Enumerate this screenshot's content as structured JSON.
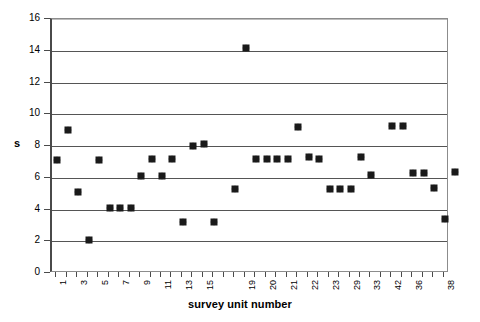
{
  "chart_data": {
    "type": "scatter",
    "title": "",
    "xlabel": "survey unit number",
    "ylabel": "s",
    "ylim": [
      0,
      16
    ],
    "ytick_step": 2,
    "yticks": [
      0,
      2,
      4,
      6,
      8,
      10,
      12,
      14,
      16
    ],
    "grid": true,
    "grid_axis": "y",
    "legend": false,
    "marker": "diamond",
    "marker_color": "#1a1a1a",
    "categories": [
      "1",
      "2",
      "3",
      "4",
      "5",
      "6",
      "7",
      "8",
      "9",
      "10",
      "11",
      "12",
      "13",
      "14",
      "15",
      "16",
      "17",
      "18",
      "19",
      "20",
      "21",
      "22",
      "23",
      "24",
      "25",
      "26",
      "27",
      "28",
      "29",
      "30",
      "31",
      "32",
      "33",
      "34",
      "35",
      "36",
      "37",
      "38"
    ],
    "xtick_labels_shown": [
      "1",
      "3",
      "5",
      "7",
      "9",
      "11",
      "13",
      "15",
      "19",
      "20",
      "21",
      "22",
      "23",
      "29",
      "33",
      "42",
      "36",
      "38"
    ],
    "xtick_label_positions": [
      1,
      3,
      5,
      7,
      9,
      11,
      13,
      15,
      19,
      21,
      23,
      25,
      27,
      29,
      31,
      33,
      35,
      38
    ],
    "values": [
      7.1,
      9.0,
      5.1,
      2.05,
      7.1,
      4.1,
      4.1,
      4.1,
      6.1,
      7.2,
      6.1,
      7.2,
      3.2,
      8.0,
      8.15,
      3.2,
      14.2,
      5.3,
      7.2,
      7.2,
      7.2,
      7.15,
      9.2,
      7.3,
      7.2,
      5.3,
      5.3,
      5.3,
      7.3,
      6.2,
      9.25,
      9.25,
      6.3,
      6.3,
      5.35,
      6.3,
      3.4,
      6.35
    ],
    "points": [
      {
        "x": 1,
        "y": 7.1
      },
      {
        "x": 2,
        "y": 9.0
      },
      {
        "x": 3,
        "y": 5.1
      },
      {
        "x": 4,
        "y": 2.05
      },
      {
        "x": 5,
        "y": 7.1
      },
      {
        "x": 6,
        "y": 4.1
      },
      {
        "x": 7,
        "y": 4.1
      },
      {
        "x": 8,
        "y": 4.1
      },
      {
        "x": 9,
        "y": 6.1
      },
      {
        "x": 10,
        "y": 7.2
      },
      {
        "x": 11,
        "y": 6.1
      },
      {
        "x": 12,
        "y": 7.2
      },
      {
        "x": 13,
        "y": 3.2
      },
      {
        "x": 14,
        "y": 8.0
      },
      {
        "x": 15,
        "y": 8.15
      },
      {
        "x": 16,
        "y": 3.2
      },
      {
        "x": 19,
        "y": 14.2
      },
      {
        "x": 18,
        "y": 5.3
      },
      {
        "x": 20,
        "y": 7.2
      },
      {
        "x": 21,
        "y": 7.2
      },
      {
        "x": 22,
        "y": 7.2
      },
      {
        "x": 23,
        "y": 7.15
      },
      {
        "x": 24,
        "y": 9.2
      },
      {
        "x": 25,
        "y": 7.3
      },
      {
        "x": 26,
        "y": 7.2
      },
      {
        "x": 27,
        "y": 5.3
      },
      {
        "x": 28,
        "y": 5.3
      },
      {
        "x": 29,
        "y": 5.3
      },
      {
        "x": 30,
        "y": 7.3
      },
      {
        "x": 31,
        "y": 6.2
      },
      {
        "x": 33,
        "y": 9.25
      },
      {
        "x": 34,
        "y": 9.25
      },
      {
        "x": 35,
        "y": 6.3
      },
      {
        "x": 36,
        "y": 6.3
      },
      {
        "x": 37,
        "y": 5.35
      },
      {
        "x": 38,
        "y": 3.4
      },
      {
        "x": 39,
        "y": 6.35
      }
    ]
  }
}
